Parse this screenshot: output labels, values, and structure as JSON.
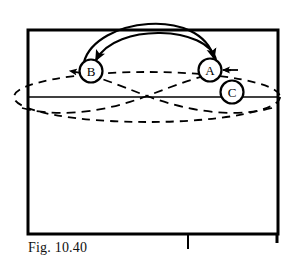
{
  "figure": {
    "caption": "Fig. 10.40",
    "type": "technical-line-diagram",
    "background_color": "#ffffff",
    "ink_color": "#000000",
    "nodes": [
      {
        "id": "B",
        "label": "B",
        "cx": 91,
        "cy": 71,
        "r": 11
      },
      {
        "id": "A",
        "label": "A",
        "cx": 210,
        "cy": 70,
        "r": 11
      },
      {
        "id": "C",
        "label": "C",
        "cx": 232,
        "cy": 92,
        "r": 11
      }
    ],
    "frame": {
      "name": "outer-rectangle",
      "x": 28,
      "y": 30,
      "width": 250,
      "height": 204,
      "stroke_width": 3
    },
    "baseline": {
      "name": "horizontal-axis-line",
      "x1": 28,
      "x2": 278,
      "y": 97,
      "stroke_width": 1.4
    },
    "bottom_tick": {
      "name": "bottom-tick-mark",
      "x": 188,
      "y1": 234,
      "y2": 248
    },
    "solid_arcs": [
      {
        "name": "outer-arc-b-to-a",
        "from": "B",
        "to": "A",
        "direction": "arrow-into-A",
        "apex_y": 14
      },
      {
        "name": "inner-arc-a-to-b",
        "from": "A",
        "to": "B",
        "direction": "arrow-into-B",
        "apex_y": 27
      }
    ],
    "dashed_ellipse": {
      "name": "dashed-boundary-ellipse",
      "cx": 147,
      "cy": 97,
      "rx": 133,
      "ry": 25
    },
    "dashed_crossing_curves": [
      {
        "name": "dashed-curve-left-to-B",
        "arrow_into": "B"
      },
      {
        "name": "dashed-curve-right-to-A",
        "arrow_into": "A"
      }
    ]
  }
}
